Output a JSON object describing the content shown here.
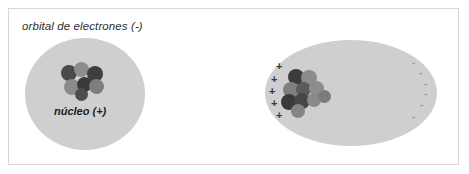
{
  "figure": {
    "width": 469,
    "height": 174,
    "background": "#ffffff",
    "border_color": "#d8d8d8"
  },
  "panels": [
    {
      "id": "neutral",
      "caption": "orbital de electrones (-)",
      "cloud": {
        "shape": "circle",
        "color": "#cfcfcf",
        "x": 25,
        "y": 38,
        "w": 120,
        "h": 112
      },
      "nucleus_label": "núcleo (+)",
      "nucleons": [
        {
          "x": 61,
          "y": 65,
          "d": 16,
          "color": "#4a4a4a"
        },
        {
          "x": 74,
          "y": 62,
          "d": 15,
          "color": "#8c8c8c"
        },
        {
          "x": 87,
          "y": 66,
          "d": 16,
          "color": "#3f3f3f"
        },
        {
          "x": 64,
          "y": 79,
          "d": 16,
          "color": "#8a8a8a"
        },
        {
          "x": 77,
          "y": 77,
          "d": 15,
          "color": "#3a3a3a"
        },
        {
          "x": 89,
          "y": 79,
          "d": 15,
          "color": "#7e7e7e"
        },
        {
          "x": 75,
          "y": 88,
          "d": 13,
          "color": "#4d4d4d"
        }
      ],
      "charges": []
    },
    {
      "id": "polarized",
      "caption": "orbital polarizado",
      "cloud": {
        "shape": "ellipse",
        "color": "#cfcfcf",
        "x": 265,
        "y": 40,
        "w": 172,
        "h": 106
      },
      "nucleus_label": "",
      "nucleons": [
        {
          "x": 288,
          "y": 69,
          "d": 16,
          "color": "#3c3c3c"
        },
        {
          "x": 301,
          "y": 70,
          "d": 16,
          "color": "#8b8b8b"
        },
        {
          "x": 283,
          "y": 82,
          "d": 16,
          "color": "#7f7f7f"
        },
        {
          "x": 296,
          "y": 82,
          "d": 15,
          "color": "#5a5a5a"
        },
        {
          "x": 309,
          "y": 81,
          "d": 15,
          "color": "#8d8d8d"
        },
        {
          "x": 281,
          "y": 94,
          "d": 16,
          "color": "#3a3a3a"
        },
        {
          "x": 294,
          "y": 93,
          "d": 16,
          "color": "#464646"
        },
        {
          "x": 307,
          "y": 93,
          "d": 14,
          "color": "#8a8a8a"
        },
        {
          "x": 291,
          "y": 104,
          "d": 14,
          "color": "#858585"
        },
        {
          "x": 318,
          "y": 90,
          "d": 13,
          "color": "#7b7b7b"
        }
      ],
      "charges": [
        {
          "sign": "+",
          "x": 276,
          "y": 61
        },
        {
          "sign": "+",
          "x": 271,
          "y": 74
        },
        {
          "sign": "+",
          "x": 269,
          "y": 86
        },
        {
          "sign": "+",
          "x": 271,
          "y": 98
        },
        {
          "sign": "+",
          "x": 276,
          "y": 110
        },
        {
          "sign": "-",
          "x": 412,
          "y": 58
        },
        {
          "sign": "-",
          "x": 419,
          "y": 68
        },
        {
          "sign": "-",
          "x": 424,
          "y": 79
        },
        {
          "sign": "-",
          "x": 424,
          "y": 89
        },
        {
          "sign": "-",
          "x": 420,
          "y": 100
        },
        {
          "sign": "-",
          "x": 412,
          "y": 112
        }
      ]
    }
  ]
}
